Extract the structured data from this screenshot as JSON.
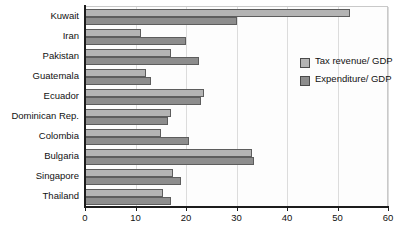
{
  "chart_data": {
    "type": "bar",
    "orientation": "horizontal",
    "title": "",
    "xlabel": "",
    "ylabel": "",
    "xlim": [
      0,
      60
    ],
    "xticks": [
      0,
      10,
      20,
      30,
      40,
      50,
      60
    ],
    "grid": true,
    "legend_position": "right",
    "categories": [
      "Kuwait",
      "Iran",
      "Pakistan",
      "Guatemala",
      "Ecuador",
      "Dominican Rep.",
      "Colombia",
      "Bulgaria",
      "Singapore",
      "Thailand"
    ],
    "series": [
      {
        "name": "Tax revenue/ GDP",
        "color": "#b4b4b4",
        "values": [
          52.5,
          11.0,
          17.0,
          12.0,
          23.5,
          17.0,
          15.0,
          33.0,
          17.5,
          15.5
        ]
      },
      {
        "name": "Expenditure/ GDP",
        "color": "#8d8d8d",
        "values": [
          30.0,
          20.0,
          22.5,
          13.0,
          23.0,
          16.5,
          20.5,
          33.5,
          19.0,
          17.0
        ]
      }
    ]
  },
  "legend": {
    "entries": [
      {
        "label": "Tax revenue/ GDP"
      },
      {
        "label": "Expenditure/ GDP"
      }
    ]
  }
}
